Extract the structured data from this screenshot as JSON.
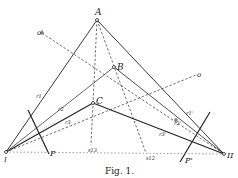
{
  "figure": {
    "caption": "Fig. 1.",
    "points": {
      "A": {
        "label": "A"
      },
      "B": {
        "label": "B"
      },
      "C": {
        "label": "C"
      },
      "I": {
        "label": "I"
      },
      "II": {
        "label": "II"
      },
      "o_prime": {
        "label": "o'"
      },
      "o": {
        "label": "o"
      },
      "s13": {
        "label": "s13"
      },
      "s12": {
        "label": "s12"
      }
    },
    "planes": {
      "P": {
        "label": "P"
      },
      "P_prime": {
        "label": "P'"
      }
    },
    "rays": {
      "r1": {
        "label": "r1"
      },
      "r2": {
        "label": "r2"
      },
      "r3": {
        "label": "r3"
      },
      "r1_prime": {
        "label": "r1'"
      },
      "r2_prime": {
        "label": "r2'"
      },
      "r3_prime": {
        "label": "r3'"
      }
    },
    "colors": {
      "ink": "#222222",
      "background": "#ffffff"
    }
  }
}
